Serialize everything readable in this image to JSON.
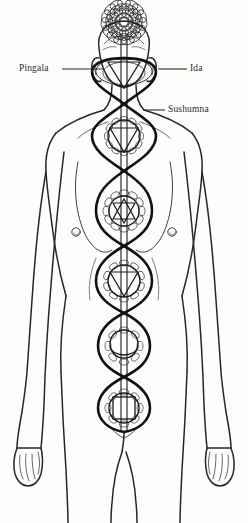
{
  "diagram": {
    "background_color": "#fdfdfb",
    "line_color": "#1a1a1a",
    "figure_outline_color": "#2b2b2b",
    "nadi_stroke_color": "#111111"
  },
  "labels": {
    "pingala": "Pingala",
    "ida": "Ida",
    "sushumna": "Sushumna"
  },
  "leader_lines": [
    {
      "name": "pingala-leader",
      "x1": 62,
      "y1": 69,
      "x2": 103,
      "y2": 69
    },
    {
      "name": "ida-leader",
      "x1": 158,
      "y1": 69,
      "x2": 187,
      "y2": 69
    },
    {
      "name": "sushumna-leader",
      "x1": 143,
      "y1": 110,
      "x2": 165,
      "y2": 110
    }
  ],
  "chakras": [
    {
      "name": "sahasrara",
      "label": "Crown",
      "symbol": "thousand-petal-lotus",
      "cx": 124,
      "cy": 22,
      "radius": 23,
      "petal_rings": 5
    },
    {
      "name": "ajna",
      "label": "Third Eye",
      "symbol": "downward-triangle",
      "cx": 124,
      "cy": 72,
      "radius": 17,
      "petals": 2
    },
    {
      "name": "vishuddha",
      "label": "Throat",
      "symbol": "downward-triangle",
      "cx": 124,
      "cy": 136,
      "radius": 19,
      "petals": 16
    },
    {
      "name": "anahata",
      "label": "Heart",
      "symbol": "hexagram",
      "cx": 124,
      "cy": 211,
      "radius": 21,
      "petals": 12
    },
    {
      "name": "manipura",
      "label": "Solar Plexus",
      "symbol": "downward-triangle",
      "cx": 124,
      "cy": 281,
      "radius": 20,
      "petals": 10
    },
    {
      "name": "svadhisthana",
      "label": "Sacral",
      "symbol": "crescent-moon",
      "cx": 124,
      "cy": 346,
      "radius": 19,
      "petals": 6
    },
    {
      "name": "muladhara",
      "label": "Root",
      "symbol": "square",
      "cx": 124,
      "cy": 408,
      "radius": 20,
      "petals": 4
    }
  ],
  "nadi_crossings": [
    {
      "name": "crossing-ajna",
      "y": 72
    },
    {
      "name": "crossing-above-vishuddha",
      "y": 104
    },
    {
      "name": "crossing-below-vishuddha",
      "y": 171
    },
    {
      "name": "crossing-above-anahata",
      "y": 211
    },
    {
      "name": "crossing-below-anahata",
      "y": 246
    },
    {
      "name": "crossing-manipura",
      "y": 281
    },
    {
      "name": "crossing-below-manipura",
      "y": 313
    },
    {
      "name": "crossing-svadhisthana",
      "y": 346
    },
    {
      "name": "crossing-below-svadhisthana",
      "y": 377
    },
    {
      "name": "crossing-muladhara",
      "y": 408
    }
  ],
  "figure": {
    "name": "human-body-outline",
    "view": "front",
    "center_x": 124
  }
}
